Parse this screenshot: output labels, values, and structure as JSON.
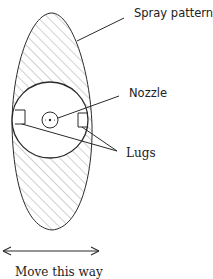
{
  "diagram": {
    "type": "labeled technical illustration",
    "labels": {
      "spray_pattern": "Spray pattern",
      "nozzle": "Nozzle",
      "lugs": "Lugs",
      "direction": "Move this way"
    },
    "colors": {
      "stroke": "#2a2a2a",
      "hatch": "#8a8a8a",
      "background": "#ffffff"
    }
  }
}
